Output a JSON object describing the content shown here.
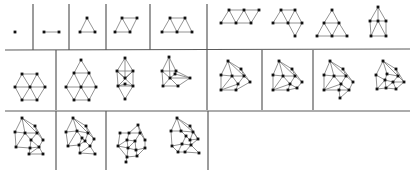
{
  "figure": {
    "colors": {
      "background": "#ffffff",
      "rule": "#5a5a5a",
      "edge": "#777777",
      "vertex": "#111111"
    },
    "rows": [
      {
        "cells": [
          {
            "graphs": [
              {
                "name": "single-vertex",
                "vertices": 1
              }
            ]
          },
          {
            "graphs": [
              {
                "name": "single-edge",
                "vertices": 2
              }
            ]
          },
          {
            "graphs": [
              {
                "name": "triangle",
                "vertices": 3
              }
            ]
          },
          {
            "graphs": [
              {
                "name": "two-triangles",
                "vertices": 4
              }
            ]
          },
          {
            "graphs": [
              {
                "name": "three-triangles",
                "vertices": 5
              }
            ]
          },
          {
            "graphs": [
              {
                "name": "four-triangles-strip",
                "vertices": 6
              },
              {
                "name": "four-triangles-bent",
                "vertices": 6
              },
              {
                "name": "large-triangle",
                "vertices": 6
              },
              {
                "name": "house",
                "vertices": 6
              }
            ]
          }
        ]
      },
      {
        "cells": [
          {
            "graphs": [
              {
                "name": "hexagon-wheel",
                "vertices": 7
              }
            ]
          },
          {
            "graphs": [
              {
                "name": "hexagon-with-apex",
                "vertices": 8
              },
              {
                "name": "double-kite",
                "vertices": 8
              },
              {
                "name": "skewed-wheel",
                "vertices": 8
              }
            ]
          },
          {
            "graphs": [
              {
                "name": "dense-9",
                "vertices": 9
              }
            ]
          },
          {
            "graphs": [
              {
                "name": "dense-10",
                "vertices": 10
              }
            ]
          },
          {
            "graphs": [
              {
                "name": "dense-11a",
                "vertices": 11
              },
              {
                "name": "dense-11b",
                "vertices": 11
              }
            ]
          }
        ]
      },
      {
        "cells": [
          {
            "graphs": [
              {
                "name": "dense-12",
                "vertices": 12
              }
            ]
          },
          {
            "graphs": [
              {
                "name": "dense-13",
                "vertices": 13
              }
            ]
          },
          {
            "graphs": [
              {
                "name": "dense-14a",
                "vertices": 14
              },
              {
                "name": "dense-14b",
                "vertices": 14
              }
            ]
          }
        ]
      }
    ]
  }
}
